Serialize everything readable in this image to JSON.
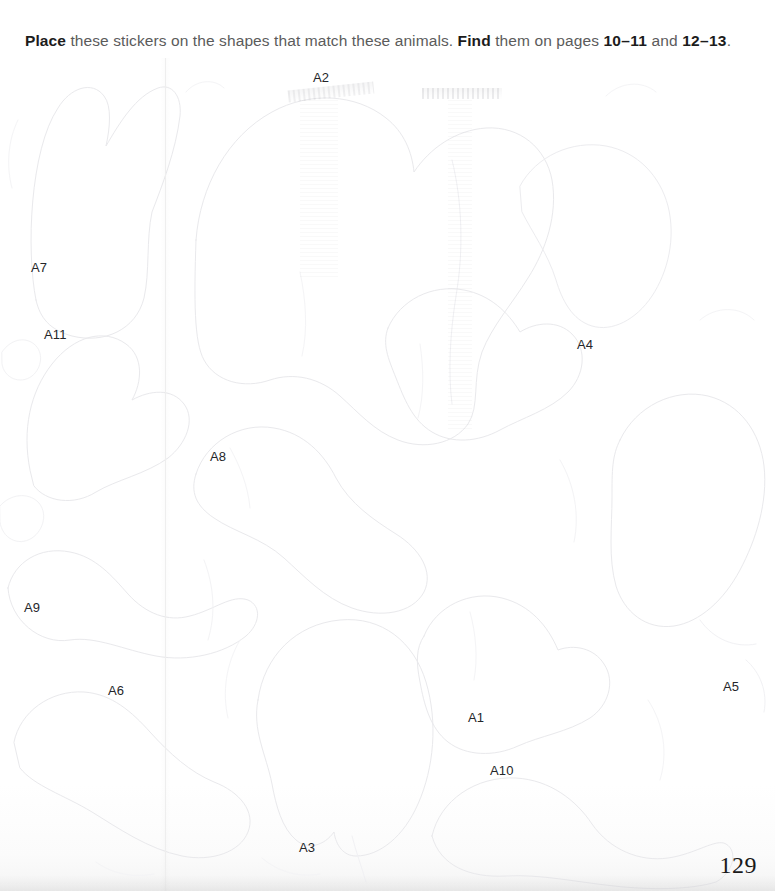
{
  "page": {
    "number": "129",
    "background_color": "#fefefe",
    "gutter_color": "#eeeeee"
  },
  "instruction": {
    "bold_1": "Place",
    "text_1": " these stickers on the shapes that match these animals. ",
    "bold_2": "Find",
    "text_2": " them on pages ",
    "pages_1": "10–11",
    "text_3": " and ",
    "pages_2": "12–13",
    "text_4": ".",
    "text_color": "#5b5b5b",
    "bold_color": "#1c1c1c"
  },
  "stickers": [
    {
      "id": "A2",
      "label": "A2",
      "x": 313,
      "y": 70
    },
    {
      "id": "A7",
      "label": "A7",
      "x": 31,
      "y": 260
    },
    {
      "id": "A11",
      "label": "A11",
      "x": 44,
      "y": 327
    },
    {
      "id": "A4",
      "label": "A4",
      "x": 577,
      "y": 337
    },
    {
      "id": "A8",
      "label": "A8",
      "x": 210,
      "y": 449
    },
    {
      "id": "A9",
      "label": "A9",
      "x": 24,
      "y": 600
    },
    {
      "id": "A6",
      "label": "A6",
      "x": 108,
      "y": 683
    },
    {
      "id": "A5",
      "label": "A5",
      "x": 723,
      "y": 679
    },
    {
      "id": "A1",
      "label": "A1",
      "x": 468,
      "y": 710
    },
    {
      "id": "A10",
      "label": "A10",
      "x": 490,
      "y": 763
    },
    {
      "id": "A3",
      "label": "A3",
      "x": 299,
      "y": 840
    }
  ],
  "outline": {
    "stroke_color": "#e9e9ec",
    "stroke_color_faint": "#f2f2f4",
    "stroke_width": 1
  }
}
